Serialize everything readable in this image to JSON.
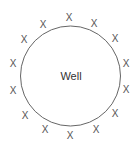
{
  "diagram": {
    "center_label": "Well",
    "circle": {
      "cx": 70.5,
      "cy": 76,
      "r": 50,
      "stroke": "#666666"
    },
    "marker_glyph": "X",
    "markers": [
      {
        "x": 69,
        "y": 17,
        "label": "X"
      },
      {
        "x": 94,
        "y": 23,
        "label": "X"
      },
      {
        "x": 115,
        "y": 38,
        "label": "X"
      },
      {
        "x": 126,
        "y": 63,
        "label": "X"
      },
      {
        "x": 126,
        "y": 89,
        "label": "X"
      },
      {
        "x": 115,
        "y": 113,
        "label": "X"
      },
      {
        "x": 96,
        "y": 129,
        "label": "X"
      },
      {
        "x": 70,
        "y": 135,
        "label": "X"
      },
      {
        "x": 45,
        "y": 129,
        "label": "X"
      },
      {
        "x": 25,
        "y": 115,
        "label": "X"
      },
      {
        "x": 13,
        "y": 90,
        "label": "X"
      },
      {
        "x": 13,
        "y": 63,
        "label": "X"
      },
      {
        "x": 24,
        "y": 39,
        "label": "X"
      },
      {
        "x": 43,
        "y": 24,
        "label": "X"
      }
    ]
  }
}
